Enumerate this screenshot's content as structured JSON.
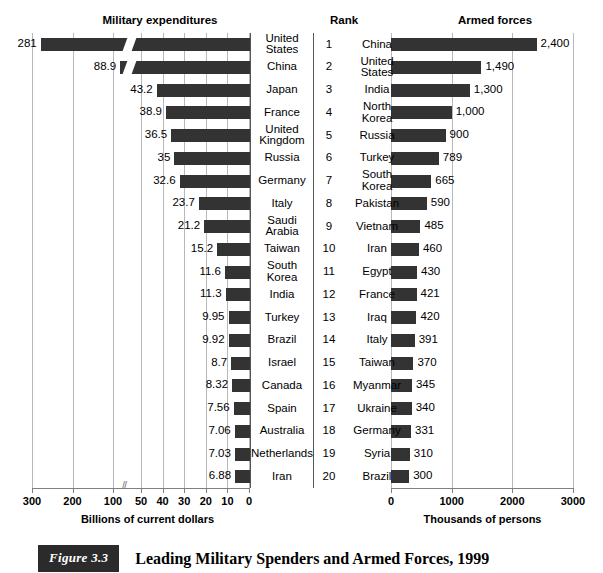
{
  "figure": {
    "badge": "Figure 3.3",
    "caption": "Leading Military Spenders and Armed Forces, 1999"
  },
  "panels": {
    "left_title": "Military expenditures",
    "rank_title": "Rank",
    "right_title": "Armed forces",
    "left_axis_caption": "Billions of current dollars",
    "right_axis_caption": "Thousands of persons"
  },
  "chart_data": [
    {
      "type": "bar",
      "orientation": "horizontal",
      "direction": "right-to-left",
      "title": "Military expenditures",
      "xlabel": "Billions of current dollars",
      "ylabel": "",
      "axis_break": true,
      "axis_break_between": [
        100,
        50
      ],
      "tick_labels": [
        "300",
        "200",
        "100",
        "50",
        "40",
        "30",
        "20",
        "10",
        "0"
      ],
      "tick_values": [
        300,
        200,
        100,
        50,
        40,
        30,
        20,
        10,
        0
      ],
      "grid": true,
      "categories": [
        "United States",
        "China",
        "Japan",
        "France",
        "United Kingdom",
        "Russia",
        "Germany",
        "Italy",
        "Saudi Arabia",
        "Taiwan",
        "South Korea",
        "India",
        "Turkey",
        "Brazil",
        "Israel",
        "Canada",
        "Spain",
        "Australia",
        "Netherlands",
        "Iran"
      ],
      "values": [
        281,
        88.9,
        43.2,
        38.9,
        36.5,
        35,
        32.6,
        23.7,
        21.2,
        15.2,
        11.6,
        11.3,
        9.95,
        9.92,
        8.7,
        8.32,
        7.56,
        7.06,
        7.03,
        6.88
      ],
      "value_labels": [
        "281",
        "88.9",
        "43.2",
        "38.9",
        "36.5",
        "35",
        "32.6",
        "23.7",
        "21.2",
        "15.2",
        "11.6",
        "11.3",
        "9.95",
        "9.92",
        "8.7",
        "8.32",
        "7.56",
        "7.06",
        "7.03",
        "6.88"
      ]
    },
    {
      "type": "bar",
      "orientation": "horizontal",
      "direction": "left-to-right",
      "title": "Armed forces",
      "xlabel": "Thousands of persons",
      "ylabel": "",
      "axis_break": false,
      "tick_labels": [
        "0",
        "1000",
        "2000",
        "3000"
      ],
      "tick_values": [
        0,
        1000,
        2000,
        3000
      ],
      "xlim": [
        0,
        3000
      ],
      "grid": true,
      "categories": [
        "China",
        "United States",
        "India",
        "North Korea",
        "Russia",
        "Turkey",
        "South Korea",
        "Pakistan",
        "Vietnam",
        "Iran",
        "Egypt",
        "France",
        "Iraq",
        "Italy",
        "Taiwan",
        "Myanmar",
        "Ukraine",
        "Germany",
        "Syria",
        "Brazil"
      ],
      "values": [
        2400,
        1490,
        1300,
        1000,
        900,
        789,
        665,
        590,
        485,
        460,
        430,
        421,
        420,
        391,
        370,
        345,
        340,
        331,
        310,
        300
      ],
      "value_labels": [
        "2,400",
        "1,490",
        "1,300",
        "1,000",
        "900",
        "789",
        "665",
        "590",
        "485",
        "460",
        "430",
        "421",
        "420",
        "391",
        "370",
        "345",
        "340",
        "331",
        "310",
        "300"
      ]
    }
  ],
  "ranks": [
    "1",
    "2",
    "3",
    "4",
    "5",
    "6",
    "7",
    "8",
    "9",
    "10",
    "11",
    "12",
    "13",
    "14",
    "15",
    "16",
    "17",
    "18",
    "19",
    "20"
  ],
  "colors": {
    "bar": "#333333",
    "gridline": "#b8b8b8",
    "axis": "#808080",
    "badge_bg": "#2b2b2b",
    "text": "#000000"
  }
}
